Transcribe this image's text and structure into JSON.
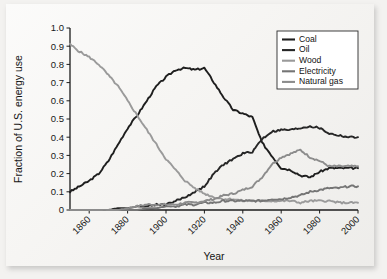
{
  "chart_data": {
    "type": "line",
    "title": "",
    "xlabel": "Year",
    "ylabel": "Fraction of U.S. energy use",
    "xlim": [
      1850,
      2000
    ],
    "ylim": [
      0,
      1.0
    ],
    "grid": false,
    "legend_position": "top-right",
    "xticks": [
      1860,
      1880,
      1900,
      1920,
      1940,
      1960,
      1980,
      2000
    ],
    "xtick_labels": [
      "1860",
      "1880",
      "1900",
      "1920",
      "1940",
      "1960",
      "1980",
      "2000"
    ],
    "yticks": [
      0,
      0.1,
      0.2,
      0.3,
      0.4,
      0.5,
      0.6,
      0.7,
      0.8,
      0.9,
      1.0
    ],
    "ytick_labels": [
      "0",
      "0.1",
      "0.2",
      "0.3",
      "0.4",
      "0.5",
      "0.6",
      "0.7",
      "0.8",
      "0.9",
      "1.0"
    ],
    "x": [
      1850,
      1855,
      1860,
      1865,
      1870,
      1875,
      1880,
      1885,
      1890,
      1895,
      1900,
      1905,
      1910,
      1915,
      1920,
      1925,
      1930,
      1935,
      1940,
      1945,
      1950,
      1955,
      1960,
      1965,
      1970,
      1975,
      1980,
      1985,
      1990,
      1995,
      2000
    ],
    "series": [
      {
        "name": "Coal",
        "color": "#1e1e1e",
        "width": 1.9,
        "values": [
          0.1,
          0.13,
          0.16,
          0.2,
          0.27,
          0.36,
          0.45,
          0.52,
          0.6,
          0.68,
          0.73,
          0.77,
          0.78,
          0.77,
          0.78,
          0.7,
          0.62,
          0.55,
          0.53,
          0.51,
          0.37,
          0.3,
          0.23,
          0.22,
          0.19,
          0.18,
          0.21,
          0.23,
          0.23,
          0.23,
          0.23
        ]
      },
      {
        "name": "Oil",
        "color": "#262626",
        "width": 1.9,
        "values": [
          0.0,
          0.0,
          0.0,
          0.0,
          0.0,
          0.01,
          0.01,
          0.02,
          0.02,
          0.03,
          0.03,
          0.05,
          0.07,
          0.1,
          0.13,
          0.2,
          0.25,
          0.28,
          0.31,
          0.32,
          0.39,
          0.43,
          0.44,
          0.44,
          0.45,
          0.46,
          0.45,
          0.42,
          0.41,
          0.4,
          0.4
        ]
      },
      {
        "name": "Wood",
        "color": "#9a9a9a",
        "width": 1.9,
        "values": [
          0.91,
          0.87,
          0.84,
          0.8,
          0.74,
          0.68,
          0.6,
          0.52,
          0.44,
          0.36,
          0.28,
          0.22,
          0.16,
          0.12,
          0.09,
          0.07,
          0.06,
          0.06,
          0.05,
          0.05,
          0.05,
          0.05,
          0.05,
          0.05,
          0.04,
          0.05,
          0.05,
          0.05,
          0.04,
          0.04,
          0.04
        ]
      },
      {
        "name": "Electricity",
        "color": "#757575",
        "width": 1.9,
        "values": [
          0.0,
          0.0,
          0.0,
          0.0,
          0.0,
          0.0,
          0.0,
          0.0,
          0.01,
          0.01,
          0.02,
          0.02,
          0.03,
          0.03,
          0.04,
          0.04,
          0.05,
          0.05,
          0.05,
          0.05,
          0.05,
          0.06,
          0.06,
          0.07,
          0.08,
          0.1,
          0.11,
          0.12,
          0.12,
          0.13,
          0.13
        ]
      },
      {
        "name": "Natural gas",
        "color": "#8c8c8c",
        "width": 1.9,
        "values": [
          0.0,
          0.0,
          0.0,
          0.0,
          0.0,
          0.0,
          0.01,
          0.02,
          0.03,
          0.03,
          0.03,
          0.03,
          0.04,
          0.04,
          0.05,
          0.06,
          0.08,
          0.09,
          0.11,
          0.13,
          0.18,
          0.25,
          0.29,
          0.31,
          0.33,
          0.29,
          0.27,
          0.24,
          0.24,
          0.24,
          0.24
        ]
      }
    ],
    "notes": [
      "Wood dominates in 1850 at ~0.91 and declines steadily.",
      "Coal overtakes wood around 1884 near 0.49 and peaks ~0.78 around 1910.",
      "Oil rises after 1920 and ends near 0.40 in 2000.",
      "Natural gas peaks near 0.33 around 1970 then settles near 0.24."
    ]
  }
}
